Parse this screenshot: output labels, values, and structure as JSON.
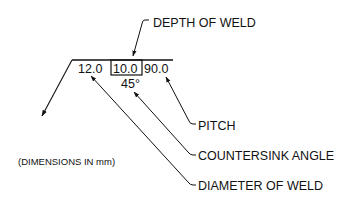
{
  "diagram": {
    "symbol": {
      "left_value": "12.0",
      "boxed_value": "10.0",
      "right_value": "90.0",
      "angle_value": "45°"
    },
    "labels": {
      "depth": "DEPTH OF WELD",
      "pitch": "PITCH",
      "countersink": "COUNTERSINK ANGLE",
      "diameter": "DIAMETER OF WELD",
      "units_note": "(DIMENSIONS IN mm)"
    },
    "colors": {
      "ink": "#111111",
      "background": "#ffffff"
    }
  }
}
